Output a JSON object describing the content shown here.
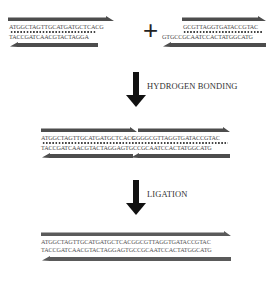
{
  "diagram": {
    "fragment_left": {
      "top_strand": "ATGGCTAGTTGCATGATGCTCACG",
      "bottom_strand": "TACCGATCAACGTACTAGGA"
    },
    "operator": "+",
    "fragment_right": {
      "top_strand": "GCGTTAGGTGATACCGTAC",
      "bottom_strand": "GTGCCGCAATCCACTATGGCATG"
    },
    "step1": {
      "label": "HYDROGEN BONDING"
    },
    "annealed": {
      "top_left": "ATGGCTAGTTGCATGATGCTCACG",
      "top_right": "CGGGCGTTAGGTGATACCGTAC",
      "bottom": "TACCGATCAACGTACTAGGAGTGCCGCAATCCACTATGGCATG"
    },
    "step2": {
      "label": "LIGATION"
    },
    "ligated": {
      "top": "ATGGCTAGTTGCATGATGCTCACGGCGTTAGGTGATACCGTAC",
      "bottom": "TACCGATCAACGTACTAGGAGTGCCGCAATCCACTATGGCATG"
    },
    "colors": {
      "strand_bar": "#4d4d4d",
      "arrow": "#111111",
      "text": "#333333"
    }
  }
}
